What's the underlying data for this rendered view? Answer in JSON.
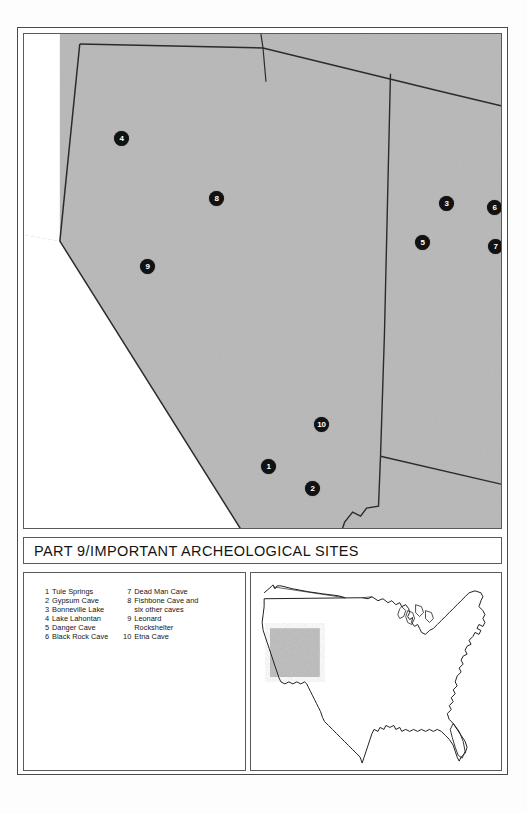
{
  "page": {
    "title": "PART 9/IMPORTANT ARCHEOLOGICAL SITES",
    "background_color": "#ffffff",
    "frame_color": "#4a4a4a"
  },
  "map": {
    "name": "great-basin-archeological-sites-map",
    "fill_color": "#b8b8b8",
    "border_color": "#2b2b2b",
    "region": "Great Basin (Nevada, Utah, eastern California, Oregon, Idaho, Arizona)",
    "markers": [
      {
        "id": "1",
        "label": "1",
        "x": 244,
        "y": 432,
        "site": "Tule Springs"
      },
      {
        "id": "2",
        "label": "2",
        "x": 288,
        "y": 454,
        "site": "Gypsum Cave"
      },
      {
        "id": "3",
        "label": "3",
        "x": 422,
        "y": 169,
        "site": "Bonneville Lake"
      },
      {
        "id": "4",
        "label": "4",
        "x": 97,
        "y": 104,
        "site": "Lake Lahontan"
      },
      {
        "id": "5",
        "label": "5",
        "x": 398,
        "y": 208,
        "site": "Danger Cave"
      },
      {
        "id": "6",
        "label": "6",
        "x": 470,
        "y": 173,
        "site": "Black Rock Cave"
      },
      {
        "id": "7",
        "label": "7",
        "x": 471,
        "y": 212,
        "site": "Dead Man Cave"
      },
      {
        "id": "8",
        "label": "8",
        "x": 192,
        "y": 164,
        "site": "Fishbone Cave and six other caves"
      },
      {
        "id": "9",
        "label": "9",
        "x": 123,
        "y": 232,
        "site": "Leonard Rockshelter"
      },
      {
        "id": "10",
        "label": "10",
        "x": 297,
        "y": 390,
        "site": "Etna Cave"
      }
    ]
  },
  "legend": {
    "name": "archeological-sites-legend",
    "column_left": [
      {
        "num": "1",
        "label": "Tule Springs"
      },
      {
        "num": "2",
        "label": "Gypsum Cave"
      },
      {
        "num": "3",
        "label": "Bonneville Lake"
      },
      {
        "num": "4",
        "label": "Lake Lahontan"
      },
      {
        "num": "5",
        "label": "Danger Cave"
      },
      {
        "num": "6",
        "label": "Black Rock Cave"
      }
    ],
    "column_right": [
      {
        "num": "7",
        "label": "Dead Man Cave",
        "continuation": ""
      },
      {
        "num": "8",
        "label": "Fishbone Cave and",
        "continuation": "six other caves"
      },
      {
        "num": "9",
        "label": "Leonard",
        "continuation": "Rockshelter"
      },
      {
        "num": "10",
        "label": "Etna Cave",
        "continuation": ""
      }
    ]
  },
  "inset": {
    "name": "united-states-locator-inset",
    "description": "Outline map of the contiguous United States",
    "highlight_region": "Great Basin",
    "highlight_color": "#bcbcbc",
    "outline_color": "#1f1f1f"
  }
}
